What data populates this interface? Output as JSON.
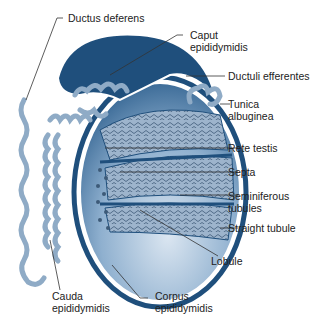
{
  "colors": {
    "dark_blue": "#1f4f7c",
    "mid_blue": "#4b7aa6",
    "light_blue": "#c9d9ea",
    "tubule_blue": "#8fabc6",
    "line": "#333333"
  },
  "labels": [
    {
      "id": "ductus-deferens",
      "text": "Ductus deferens"
    },
    {
      "id": "caput-epididymidis",
      "line1": "Caput",
      "line2": "epididymidis"
    },
    {
      "id": "ductuli-efferentes",
      "text": "Ductuli efferentes"
    },
    {
      "id": "tunica-albuginea",
      "line1": "Tunica",
      "line2": "albuginea"
    },
    {
      "id": "rete-testis",
      "text": "Rete testis"
    },
    {
      "id": "septa",
      "text": "Septa"
    },
    {
      "id": "seminiferous-tubules",
      "line1": "Seminiferous",
      "line2": "tubules"
    },
    {
      "id": "straight-tubule",
      "text": "Straight tubule"
    },
    {
      "id": "lobule",
      "text": "Lobule"
    },
    {
      "id": "cauda-epididymidis",
      "line1": "Cauda",
      "line2": "epididymidis"
    },
    {
      "id": "corpus-epididymidis",
      "line1": "Corpus",
      "line2": "epididymidis"
    }
  ]
}
